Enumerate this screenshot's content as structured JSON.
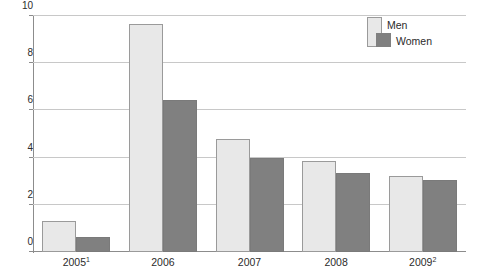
{
  "chart_data": {
    "type": "bar",
    "title": "",
    "subtitle": "",
    "xlabel": "",
    "ylabel": "",
    "ylim": [
      0,
      10
    ],
    "yticks": [
      0,
      2,
      4,
      6,
      8,
      10
    ],
    "ytick_labels": [
      "0",
      "2",
      "4",
      "6",
      "8",
      "10"
    ],
    "grid": true,
    "legend_position": "top-right",
    "categories": [
      "2005",
      "2006",
      "2007",
      "2008",
      "2009"
    ],
    "category_labels": [
      "2005",
      "2006",
      "2007",
      "2008",
      "2009"
    ],
    "category_footnotes": [
      "1",
      "",
      "",
      "",
      "2"
    ],
    "series": [
      {
        "name": "Men",
        "color": "#e8e8e8",
        "border_color": "#9a9a9a",
        "values": [
          1.3,
          9.65,
          4.77,
          3.85,
          3.22
        ]
      },
      {
        "name": "Women",
        "color": "#808080",
        "border_color": "#7a7a7a",
        "values": [
          0.65,
          6.45,
          3.97,
          3.35,
          3.07
        ]
      }
    ]
  },
  "legend": {
    "items": [
      {
        "label": "Men"
      },
      {
        "label": "Women"
      }
    ]
  },
  "colors": {
    "men": "#e8e8e8",
    "women": "#808080",
    "grid": "#c8c8c8",
    "axis": "#8c8c8c",
    "text": "#2b2b2b",
    "background": "#ffffff"
  }
}
